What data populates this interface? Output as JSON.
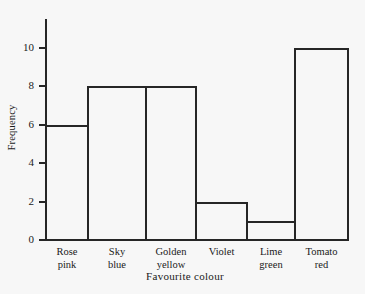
{
  "chart_data": {
    "type": "bar",
    "title": "",
    "subtitle": "",
    "xlabel": "Favourite colour",
    "ylabel": "Frequency",
    "categories": [
      "Rose pink",
      "Sky blue",
      "Golden yellow",
      "Violet",
      "Lime green",
      "Tomato red"
    ],
    "category_lines": [
      [
        "Rose",
        "pink"
      ],
      [
        "Sky",
        "blue"
      ],
      [
        "Golden",
        "yellow"
      ],
      [
        "Violet"
      ],
      [
        "Lime",
        "green"
      ],
      [
        "Tomato",
        "red"
      ]
    ],
    "values": [
      6,
      8,
      8,
      2,
      1,
      10
    ],
    "ylim": [
      0,
      10
    ],
    "ytick_labels": [
      "10",
      "8",
      "6",
      "4",
      "2",
      "0"
    ],
    "ytick_values": [
      10,
      8,
      6,
      4,
      2,
      0
    ],
    "grid": false,
    "legend": null,
    "bars_adjacent": true,
    "colors": {
      "ink": "#262626",
      "background": "#f7f7f7",
      "bar_fill": "transparent",
      "bar_stroke": "#262626"
    }
  }
}
